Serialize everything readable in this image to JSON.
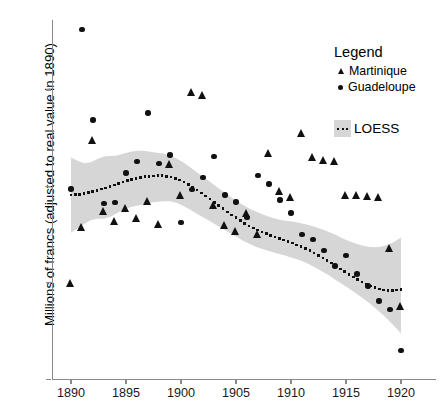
{
  "chart_data": {
    "type": "scatter",
    "title": "",
    "xlabel": "",
    "ylabel": "Millions of francs (adjusted to real value in 1890)",
    "xlim": [
      1889.0,
      1921.5
    ],
    "ylim": [
      2.0,
      9.45
    ],
    "xticks": [
      1890,
      1895,
      1900,
      1905,
      1910,
      1915,
      1920
    ],
    "yticks": [
      2,
      4,
      6,
      8
    ],
    "grid": false,
    "legend": {
      "title": "Legend",
      "position": "top-right",
      "entries": [
        {
          "label": "Martinique",
          "marker": "triangle",
          "color": "#111111"
        },
        {
          "label": "Guadeloupe",
          "marker": "circle",
          "color": "#111111"
        },
        {
          "label": "LOESS",
          "marker": "dotted-line-with-band",
          "color": "#111111",
          "band_color": "#d6d6d6"
        }
      ]
    },
    "series": [
      {
        "name": "Guadeloupe",
        "marker": "circle",
        "x": [
          1890,
          1891,
          1892,
          1893,
          1894,
          1895,
          1896,
          1897,
          1898,
          1899,
          1900,
          1901,
          1902,
          1903,
          1904,
          1905,
          1906,
          1907,
          1908,
          1909,
          1910,
          1911,
          1912,
          1913,
          1914,
          1915,
          1916,
          1917,
          1918,
          1919,
          1920
        ],
        "y": [
          5.95,
          9.25,
          7.38,
          5.65,
          5.66,
          6.28,
          6.52,
          7.52,
          6.48,
          6.65,
          5.25,
          5.93,
          6.18,
          6.62,
          5.82,
          5.68,
          5.35,
          6.23,
          6.05,
          5.72,
          5.45,
          5.0,
          4.9,
          4.67,
          4.35,
          4.57,
          4.18,
          3.93,
          3.62,
          3.45,
          2.6
        ]
      },
      {
        "name": "Martinique",
        "marker": "triangle",
        "x": [
          1890,
          1891,
          1892,
          1893,
          1894,
          1895,
          1896,
          1897,
          1898,
          1899,
          1900,
          1901,
          1902,
          1903,
          1904,
          1905,
          1906,
          1907,
          1908,
          1909,
          1910,
          1911,
          1912,
          1913,
          1914,
          1915,
          1916,
          1917,
          1918,
          1919,
          1920
        ],
        "y": [
          4.0,
          5.15,
          6.95,
          5.48,
          5.28,
          5.55,
          5.35,
          5.7,
          5.22,
          6.47,
          5.82,
          7.95,
          7.9,
          5.62,
          5.2,
          5.08,
          5.45,
          5.0,
          6.68,
          5.9,
          5.78,
          7.1,
          6.6,
          6.55,
          6.52,
          5.82,
          5.82,
          5.8,
          5.78,
          4.72,
          3.52
        ]
      }
    ],
    "loess": {
      "name": "LOESS",
      "x": [
        1890,
        1890.6,
        1891.2,
        1891.8,
        1892.4,
        1893,
        1893.6,
        1894.2,
        1894.8,
        1895.4,
        1896,
        1896.6,
        1897.2,
        1897.8,
        1898.4,
        1899,
        1899.6,
        1900.2,
        1900.8,
        1901.4,
        1902,
        1902.6,
        1903.2,
        1903.8,
        1904.4,
        1905,
        1905.6,
        1906.2,
        1906.8,
        1907.4,
        1908,
        1908.6,
        1909.2,
        1909.8,
        1910.4,
        1911,
        1911.6,
        1912.2,
        1912.8,
        1913.4,
        1914,
        1914.6,
        1915.2,
        1915.8,
        1916.4,
        1917,
        1917.6,
        1918.2,
        1918.8,
        1919.4,
        1920
      ],
      "y": [
        5.82,
        5.83,
        5.85,
        5.88,
        5.92,
        5.96,
        6.0,
        6.05,
        6.1,
        6.14,
        6.17,
        6.2,
        6.21,
        6.22,
        6.22,
        6.2,
        6.16,
        6.1,
        6.02,
        5.93,
        5.84,
        5.74,
        5.64,
        5.54,
        5.44,
        5.35,
        5.26,
        5.18,
        5.11,
        5.05,
        5.0,
        4.95,
        4.9,
        4.85,
        4.8,
        4.74,
        4.68,
        4.61,
        4.53,
        4.45,
        4.36,
        4.27,
        4.18,
        4.1,
        4.02,
        3.95,
        3.9,
        3.86,
        3.84,
        3.84,
        3.86
      ],
      "band_upper": [
        6.6,
        6.53,
        6.48,
        6.5,
        6.57,
        6.62,
        6.63,
        6.64,
        6.68,
        6.72,
        6.74,
        6.74,
        6.72,
        6.7,
        6.68,
        6.64,
        6.58,
        6.5,
        6.4,
        6.3,
        6.2,
        6.1,
        6.0,
        5.9,
        5.8,
        5.7,
        5.62,
        5.54,
        5.48,
        5.42,
        5.37,
        5.33,
        5.3,
        5.28,
        5.26,
        5.23,
        5.2,
        5.16,
        5.11,
        5.06,
        5.0,
        4.93,
        4.87,
        4.82,
        4.78,
        4.75,
        4.74,
        4.75,
        4.79,
        4.85,
        4.94
      ],
      "band_lower": [
        5.04,
        5.13,
        5.22,
        5.3,
        5.33,
        5.33,
        5.37,
        5.45,
        5.52,
        5.57,
        5.6,
        5.63,
        5.66,
        5.68,
        5.69,
        5.69,
        5.66,
        5.6,
        5.52,
        5.44,
        5.36,
        5.28,
        5.2,
        5.12,
        5.04,
        4.96,
        4.88,
        4.81,
        4.75,
        4.7,
        4.66,
        4.62,
        4.58,
        4.54,
        4.5,
        4.45,
        4.39,
        4.32,
        4.24,
        4.16,
        4.07,
        3.98,
        3.89,
        3.8,
        3.7,
        3.6,
        3.49,
        3.37,
        3.24,
        3.1,
        2.95
      ]
    }
  },
  "axis": {
    "ylabel": "Millions of francs (adjusted to real value in 1890)",
    "yticklabels": [
      "8",
      "6",
      "4",
      "2"
    ],
    "xticklabels": [
      "1890",
      "1895",
      "1900",
      "1905",
      "1910",
      "1915",
      "1920"
    ]
  },
  "legend": {
    "title": "Legend",
    "martinique": "Martinique",
    "guadeloupe": "Guadeloupe",
    "loess": "LOESS"
  },
  "colors": {
    "marker": "#111111",
    "band": "#d6d6d6",
    "axis": "#8a8a8a"
  }
}
